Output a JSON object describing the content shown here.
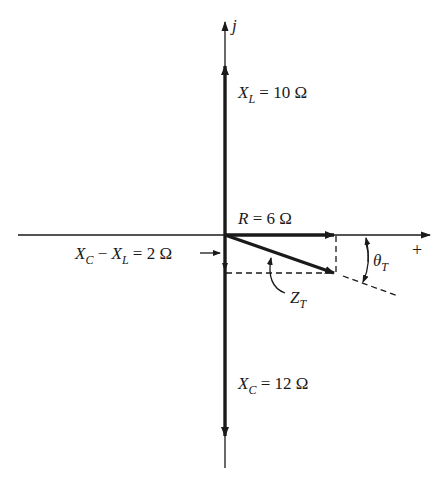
{
  "diagram": {
    "type": "impedance-phasor-diagram",
    "colors": {
      "ink": "#1a1a1a",
      "background": "#ffffff"
    },
    "axes": {
      "imaginary_label": "j",
      "real_positive_label": "+"
    },
    "phasors": {
      "XL": {
        "symbol": "X",
        "subscript": "L",
        "value_text": " = 10 Ω",
        "value": 10,
        "unit": "Ω"
      },
      "R": {
        "symbol": "R",
        "value_text": " = 6 Ω",
        "value": 6,
        "unit": "Ω"
      },
      "XC": {
        "symbol": "X",
        "subscript": "C",
        "value_text": " = 12 Ω",
        "value": 12,
        "unit": "Ω"
      },
      "diff": {
        "symbol1": "X",
        "sub1": "C",
        "minus": " − ",
        "symbol2": "X",
        "sub2": "L",
        "value_text": " = 2 Ω",
        "value": 2,
        "unit": "Ω"
      },
      "ZT": {
        "symbol": "Z",
        "subscript": "T"
      }
    },
    "angle": {
      "symbol": "θ",
      "subscript": "T"
    }
  }
}
